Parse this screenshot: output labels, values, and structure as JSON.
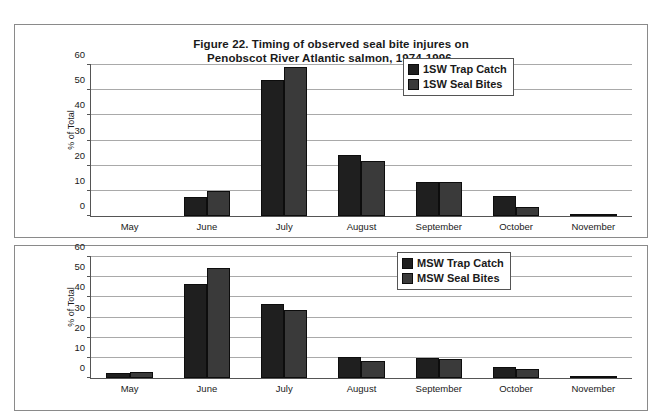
{
  "figure": {
    "title_line1": "Figure 22. Timing of observed seal bite injures on",
    "title_line2": "Penobscot River Atlantic salmon, 1974-1996."
  },
  "colors": {
    "series_trap_catch": "#1f1f1f",
    "series_seal_bites": "#3a3a3a",
    "gridline": "#a9a9a9",
    "axis": "#555555",
    "panel_border": "#8a8a8a",
    "background": "#ffffff"
  },
  "chart_data": [
    {
      "type": "bar",
      "id": "top",
      "title": "Figure 22. Timing of observed seal bite injures on Penobscot River Atlantic salmon, 1974-1996.",
      "xlabel": "",
      "ylabel": "% of Total",
      "ylim": [
        0,
        60
      ],
      "yticks": [
        0,
        10,
        20,
        30,
        40,
        50,
        60
      ],
      "grid": true,
      "legend_position": "upper right",
      "categories": [
        "May",
        "June",
        "July",
        "August",
        "September",
        "October",
        "November"
      ],
      "series": [
        {
          "name": "1SW Trap Catch",
          "values": [
            0,
            7,
            53.5,
            24,
            13,
            7.5,
            0.5
          ]
        },
        {
          "name": "1SW Seal Bites",
          "values": [
            0,
            9.5,
            59,
            21.5,
            13,
            3,
            0.5
          ]
        }
      ]
    },
    {
      "type": "bar",
      "id": "bottom",
      "title": "",
      "xlabel": "",
      "ylabel": "% of Total",
      "ylim": [
        0,
        60
      ],
      "yticks": [
        0,
        10,
        20,
        30,
        40,
        50,
        60
      ],
      "grid": true,
      "legend_position": "upper right",
      "categories": [
        "May",
        "June",
        "July",
        "August",
        "September",
        "October",
        "November"
      ],
      "series": [
        {
          "name": "MSW Trap Catch",
          "values": [
            2,
            46,
            36,
            10,
            9.5,
            5,
            0.5
          ]
        },
        {
          "name": "MSW Seal Bites",
          "values": [
            2.5,
            54,
            33,
            8,
            9,
            4,
            0.5
          ]
        }
      ]
    }
  ]
}
